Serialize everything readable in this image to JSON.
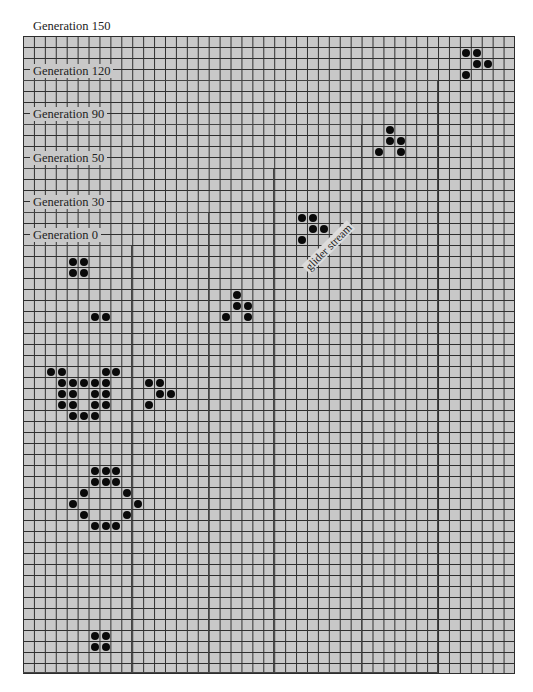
{
  "figure": {
    "grid": {
      "columns": 45,
      "rows": 58,
      "background": "#c8c8c8",
      "line_color": "#2e2e2e"
    },
    "generation_labels": [
      {
        "label": "Generation 150",
        "top_row": 0,
        "right_col": 45
      },
      {
        "label": "Generation 120",
        "top_row": 4,
        "right_col": 38
      },
      {
        "label": "Generation 90",
        "top_row": 8,
        "right_col": 31
      },
      {
        "label": "Generation 50",
        "top_row": 12,
        "right_col": 23
      },
      {
        "label": "Generation 30",
        "top_row": 16,
        "right_col": 17
      },
      {
        "label": "Generation 0",
        "top_row": 19,
        "right_col": 10
      }
    ],
    "annotation": {
      "label": "glider stream"
    },
    "live_cells": [
      [
        40,
        1
      ],
      [
        41,
        1
      ],
      [
        41,
        2
      ],
      [
        42,
        2
      ],
      [
        40,
        3
      ],
      [
        33,
        8
      ],
      [
        33,
        9
      ],
      [
        34,
        9
      ],
      [
        32,
        10
      ],
      [
        34,
        10
      ],
      [
        25,
        16
      ],
      [
        26,
        16
      ],
      [
        26,
        17
      ],
      [
        27,
        17
      ],
      [
        25,
        18
      ],
      [
        4,
        20
      ],
      [
        5,
        20
      ],
      [
        4,
        21
      ],
      [
        5,
        21
      ],
      [
        19,
        23
      ],
      [
        19,
        24
      ],
      [
        20,
        24
      ],
      [
        18,
        25
      ],
      [
        20,
        25
      ],
      [
        6,
        25
      ],
      [
        7,
        25
      ],
      [
        2,
        30
      ],
      [
        3,
        30
      ],
      [
        7,
        30
      ],
      [
        8,
        30
      ],
      [
        3,
        31
      ],
      [
        4,
        31
      ],
      [
        5,
        31
      ],
      [
        6,
        31
      ],
      [
        7,
        31
      ],
      [
        3,
        32
      ],
      [
        4,
        32
      ],
      [
        6,
        32
      ],
      [
        7,
        32
      ],
      [
        3,
        33
      ],
      [
        4,
        33
      ],
      [
        6,
        33
      ],
      [
        7,
        33
      ],
      [
        4,
        34
      ],
      [
        5,
        34
      ],
      [
        6,
        34
      ],
      [
        11,
        31
      ],
      [
        12,
        31
      ],
      [
        12,
        32
      ],
      [
        13,
        32
      ],
      [
        11,
        33
      ],
      [
        6,
        39
      ],
      [
        7,
        39
      ],
      [
        8,
        39
      ],
      [
        6,
        40
      ],
      [
        7,
        40
      ],
      [
        8,
        40
      ],
      [
        5,
        41
      ],
      [
        9,
        41
      ],
      [
        4,
        42
      ],
      [
        10,
        42
      ],
      [
        5,
        43
      ],
      [
        9,
        43
      ],
      [
        6,
        44
      ],
      [
        7,
        44
      ],
      [
        8,
        44
      ],
      [
        6,
        54
      ],
      [
        7,
        54
      ],
      [
        6,
        55
      ],
      [
        7,
        55
      ]
    ]
  }
}
